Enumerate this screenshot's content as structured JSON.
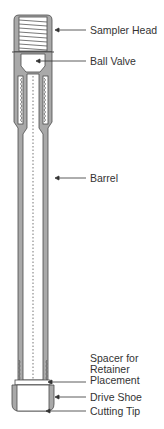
{
  "diagram": {
    "colors": {
      "body": "#a9a9a9",
      "outline": "#4a4a4a",
      "inner": "#ffffff",
      "leader": "#333333"
    },
    "labels": [
      {
        "id": "sampler-head",
        "text": "Sampler Head",
        "y": 30
      },
      {
        "id": "ball-valve",
        "text": "Ball Valve",
        "y": 61
      },
      {
        "id": "barrel",
        "text": "Barrel",
        "y": 178
      },
      {
        "id": "spacer",
        "text": "Spacer for",
        "y": 352
      },
      {
        "id": "spacer-2",
        "text": "Retainer",
        "y": 363
      },
      {
        "id": "spacer-3",
        "text": "Placement",
        "y": 374
      },
      {
        "id": "drive-shoe",
        "text": "Drive Shoe",
        "y": 392
      },
      {
        "id": "cutting-tip",
        "text": "Cutting Tip",
        "y": 405
      }
    ]
  }
}
